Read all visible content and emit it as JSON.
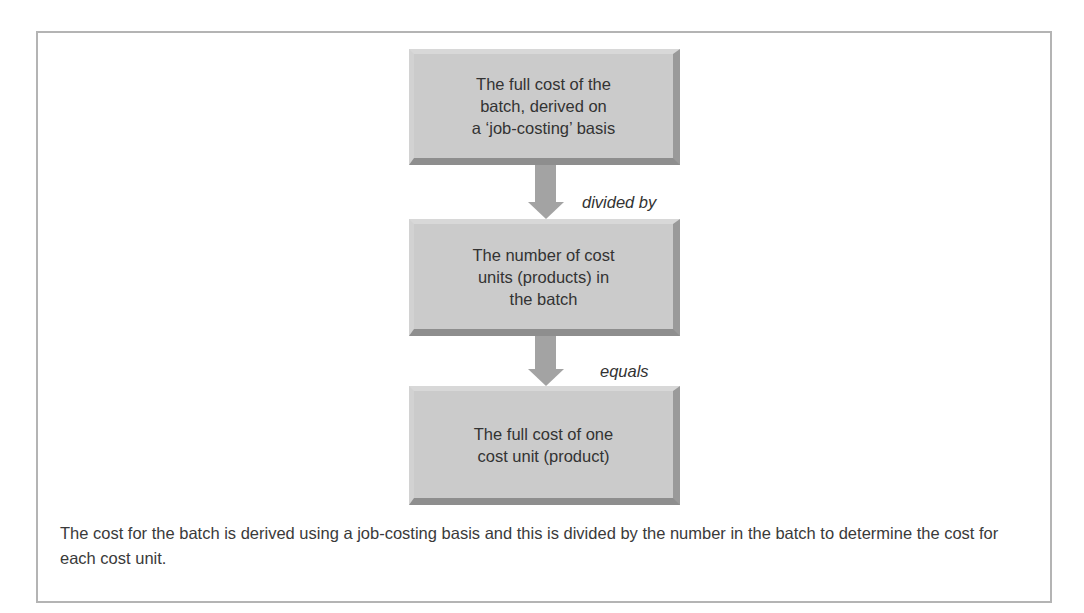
{
  "diagram": {
    "nodes": [
      {
        "id": "box1",
        "text": "The full cost of the\nbatch, derived on\na ‘job-costing’ basis"
      },
      {
        "id": "box2",
        "text": "The number of cost\nunits (products) in\nthe batch"
      },
      {
        "id": "box3",
        "text": "The full cost of one\ncost unit (product)"
      }
    ],
    "edges": [
      {
        "from": "box1",
        "to": "box2",
        "label": "divided by",
        "icon": "down-arrow-icon"
      },
      {
        "from": "box2",
        "to": "box3",
        "label": "equals",
        "icon": "down-arrow-icon"
      }
    ],
    "colors": {
      "box_face": "#cbcbcb",
      "box_bevel_dark": "#8e8e8e",
      "arrow": "#a3a3a3",
      "frame_border": "#b4b4b4",
      "text": "#333333"
    }
  },
  "caption": "The cost for the batch is derived using a job-costing basis and this is divided by the number in the batch to determine the cost for each cost unit."
}
